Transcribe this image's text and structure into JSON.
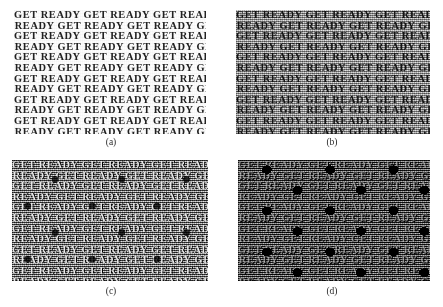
{
  "figure": {
    "background_color": "#ffffff",
    "panels": [
      {
        "id": "a",
        "caption": "(a)",
        "texture_text": "GET READY",
        "description": "clean bold serif text on white background",
        "background_color": "#fdfdfd",
        "text_color": "#222222",
        "noise_level": "none",
        "rows": 13,
        "row_text": "GET READY GET READY GET READY GET READY"
      },
      {
        "id": "b",
        "caption": "(b)",
        "texture_text": "GET READY",
        "description": "text over uniform grey noise background",
        "background_color": "#b9b9b9",
        "text_color": "#141414",
        "noise_level": "low",
        "rows": 13,
        "row_text": "GET READY GET READY GET READY GET READY"
      },
      {
        "id": "c",
        "caption": "(c)",
        "texture_text": "GET READY",
        "description": "text heavily degraded with mid-grey structured noise and dark blobs",
        "background_color": "#8a8a8a",
        "text_color": "#e8e8e8",
        "noise_level": "medium",
        "rows": 13,
        "row_text": "GET READY GET READY GET READY GET READY"
      },
      {
        "id": "d",
        "caption": "(d)",
        "texture_text": "GET READY",
        "description": "text on very dark background, strongly degraded with black blobs",
        "background_color": "#3a3a3a",
        "text_color": "#9e9e9e",
        "noise_level": "high",
        "rows": 13,
        "row_text": "GET READY GET READY GET READY GET READY"
      }
    ]
  }
}
